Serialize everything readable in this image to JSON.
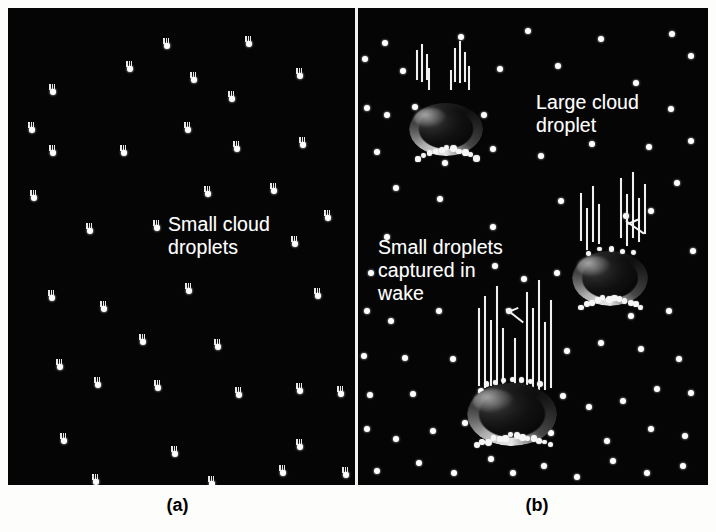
{
  "figure": {
    "background_color": "#fdfdfb",
    "panel_background_color": "#050505",
    "droplet_color": "#ffffff",
    "text_color": "#ffffff",
    "caption_color": "#000000"
  },
  "panel_a": {
    "caption": "(a)",
    "annotation": "Small cloud\ndroplets",
    "annotation_pos": {
      "x": 160,
      "y": 205
    },
    "droplet_shape": "teardrop",
    "droplets": [
      {
        "x": 155,
        "y": 30
      },
      {
        "x": 237,
        "y": 28
      },
      {
        "x": 118,
        "y": 53
      },
      {
        "x": 182,
        "y": 64
      },
      {
        "x": 288,
        "y": 60
      },
      {
        "x": 41,
        "y": 76
      },
      {
        "x": 220,
        "y": 83
      },
      {
        "x": 20,
        "y": 114
      },
      {
        "x": 176,
        "y": 114
      },
      {
        "x": 41,
        "y": 137
      },
      {
        "x": 112,
        "y": 137
      },
      {
        "x": 225,
        "y": 133
      },
      {
        "x": 291,
        "y": 129
      },
      {
        "x": 22,
        "y": 182
      },
      {
        "x": 196,
        "y": 178
      },
      {
        "x": 262,
        "y": 175
      },
      {
        "x": 316,
        "y": 202
      },
      {
        "x": 78,
        "y": 215
      },
      {
        "x": 145,
        "y": 212
      },
      {
        "x": 283,
        "y": 228
      },
      {
        "x": 40,
        "y": 282
      },
      {
        "x": 92,
        "y": 293
      },
      {
        "x": 177,
        "y": 275
      },
      {
        "x": 306,
        "y": 280
      },
      {
        "x": 131,
        "y": 326
      },
      {
        "x": 206,
        "y": 331
      },
      {
        "x": 48,
        "y": 351
      },
      {
        "x": 86,
        "y": 369
      },
      {
        "x": 146,
        "y": 372
      },
      {
        "x": 227,
        "y": 379
      },
      {
        "x": 288,
        "y": 375
      },
      {
        "x": 329,
        "y": 378
      },
      {
        "x": 52,
        "y": 425
      },
      {
        "x": 163,
        "y": 438
      },
      {
        "x": 288,
        "y": 431
      },
      {
        "x": 271,
        "y": 457
      },
      {
        "x": 84,
        "y": 466
      },
      {
        "x": 200,
        "y": 468
      },
      {
        "x": 334,
        "y": 459
      }
    ]
  },
  "panel_b": {
    "caption": "(b)",
    "droplet_shape": "round-dot",
    "annotations": [
      {
        "text": "Large cloud\ndroplet",
        "x": 178,
        "y": 83
      },
      {
        "text": "Small droplets\ncaptured in\nwake",
        "x": 20,
        "y": 228
      }
    ],
    "dots": [
      {
        "x": 24,
        "y": 32
      },
      {
        "x": 100,
        "y": 26
      },
      {
        "x": 167,
        "y": 20
      },
      {
        "x": 240,
        "y": 28
      },
      {
        "x": 311,
        "y": 23
      },
      {
        "x": 4,
        "y": 48
      },
      {
        "x": 42,
        "y": 60
      },
      {
        "x": 139,
        "y": 58
      },
      {
        "x": 197,
        "y": 55
      },
      {
        "x": 275,
        "y": 72
      },
      {
        "x": 330,
        "y": 45
      },
      {
        "x": 6,
        "y": 97
      },
      {
        "x": 26,
        "y": 104
      },
      {
        "x": 54,
        "y": 96
      },
      {
        "x": 123,
        "y": 104
      },
      {
        "x": 310,
        "y": 98
      },
      {
        "x": 16,
        "y": 141
      },
      {
        "x": 84,
        "y": 152
      },
      {
        "x": 132,
        "y": 138
      },
      {
        "x": 180,
        "y": 145
      },
      {
        "x": 231,
        "y": 133
      },
      {
        "x": 288,
        "y": 136
      },
      {
        "x": 330,
        "y": 130
      },
      {
        "x": 35,
        "y": 177
      },
      {
        "x": 79,
        "y": 188
      },
      {
        "x": 200,
        "y": 190
      },
      {
        "x": 316,
        "y": 172
      },
      {
        "x": 265,
        "y": 205
      },
      {
        "x": 26,
        "y": 226
      },
      {
        "x": 132,
        "y": 216
      },
      {
        "x": 290,
        "y": 200
      },
      {
        "x": 10,
        "y": 262
      },
      {
        "x": 332,
        "y": 240
      },
      {
        "x": 134,
        "y": 255
      },
      {
        "x": 163,
        "y": 268
      },
      {
        "x": 196,
        "y": 262
      },
      {
        "x": 225,
        "y": 270
      },
      {
        "x": 6,
        "y": 300
      },
      {
        "x": 30,
        "y": 310
      },
      {
        "x": 78,
        "y": 300
      },
      {
        "x": 148,
        "y": 300
      },
      {
        "x": 270,
        "y": 305
      },
      {
        "x": 308,
        "y": 300
      },
      {
        "x": 3,
        "y": 345
      },
      {
        "x": 44,
        "y": 347
      },
      {
        "x": 92,
        "y": 348
      },
      {
        "x": 206,
        "y": 340
      },
      {
        "x": 240,
        "y": 332
      },
      {
        "x": 280,
        "y": 338
      },
      {
        "x": 318,
        "y": 348
      },
      {
        "x": 9,
        "y": 384
      },
      {
        "x": 52,
        "y": 383
      },
      {
        "x": 120,
        "y": 380
      },
      {
        "x": 202,
        "y": 385
      },
      {
        "x": 228,
        "y": 396
      },
      {
        "x": 262,
        "y": 390
      },
      {
        "x": 296,
        "y": 378
      },
      {
        "x": 330,
        "y": 382
      },
      {
        "x": 6,
        "y": 418
      },
      {
        "x": 35,
        "y": 428
      },
      {
        "x": 72,
        "y": 420
      },
      {
        "x": 104,
        "y": 412
      },
      {
        "x": 190,
        "y": 422
      },
      {
        "x": 246,
        "y": 430
      },
      {
        "x": 290,
        "y": 418
      },
      {
        "x": 324,
        "y": 425
      },
      {
        "x": 16,
        "y": 460
      },
      {
        "x": 58,
        "y": 452
      },
      {
        "x": 93,
        "y": 462
      },
      {
        "x": 130,
        "y": 448
      },
      {
        "x": 152,
        "y": 462
      },
      {
        "x": 183,
        "y": 455
      },
      {
        "x": 216,
        "y": 466
      },
      {
        "x": 252,
        "y": 450
      },
      {
        "x": 286,
        "y": 462
      },
      {
        "x": 322,
        "y": 455
      }
    ],
    "large_droplets": [
      {
        "name": "upper-large-droplet",
        "x": 52,
        "y": 95,
        "w": 72,
        "h": 52
      },
      {
        "name": "middle-large-droplet",
        "x": 215,
        "y": 243,
        "w": 74,
        "h": 54
      },
      {
        "name": "lower-large-droplet",
        "x": 110,
        "y": 375,
        "w": 88,
        "h": 62
      }
    ]
  },
  "labels": {
    "small_cloud_droplets": "Small cloud\ndroplets",
    "large_cloud_droplet": "Large cloud\ndroplet",
    "small_droplets_captured": "Small droplets\ncaptured in\nwake",
    "caption_a": "(a)",
    "caption_b": "(b)"
  }
}
